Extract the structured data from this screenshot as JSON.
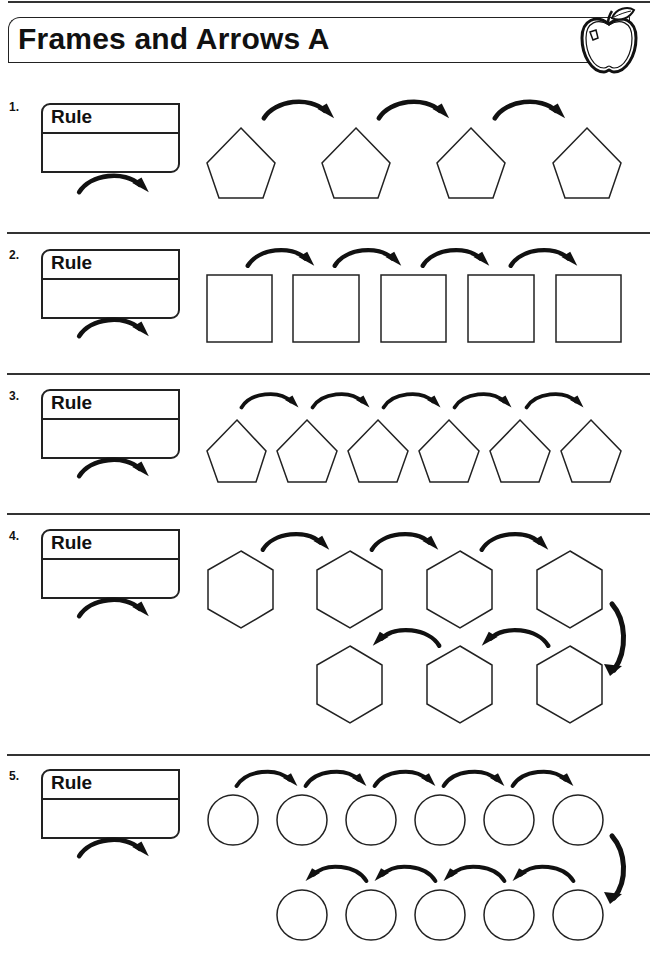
{
  "header": {
    "title": "Frames and Arrows A",
    "icon": "apple-icon"
  },
  "rule_label": "Rule",
  "problems": [
    {
      "number": "1.",
      "rule_label": "Rule",
      "shape": "pentagon",
      "frame_count": 4,
      "arrow_count": 3,
      "layout": "single-row"
    },
    {
      "number": "2.",
      "rule_label": "Rule",
      "shape": "square",
      "frame_count": 5,
      "arrow_count": 4,
      "layout": "single-row"
    },
    {
      "number": "3.",
      "rule_label": "Rule",
      "shape": "pentagon",
      "frame_count": 6,
      "arrow_count": 5,
      "layout": "single-row"
    },
    {
      "number": "4.",
      "rule_label": "Rule",
      "shape": "hexagon",
      "frame_count": 7,
      "arrow_count": 6,
      "layout": "two-rows-snake"
    },
    {
      "number": "5.",
      "rule_label": "Rule",
      "shape": "circle",
      "frame_count": 11,
      "arrow_count": 10,
      "layout": "two-rows-snake"
    }
  ],
  "colors": {
    "ink": "#222222",
    "background": "#ffffff"
  }
}
